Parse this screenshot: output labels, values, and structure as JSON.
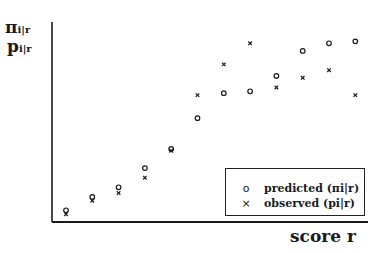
{
  "chart_data": {
    "type": "scatter",
    "title": "",
    "xlabel": "score r",
    "ylabel": [
      "πi|r",
      "pi|r"
    ],
    "x": [
      1,
      2,
      3,
      4,
      5,
      6,
      7,
      8,
      9,
      10,
      11,
      12
    ],
    "series": [
      {
        "name": "predicted (πi|r)",
        "marker": "o",
        "values": [
          0.04,
          0.11,
          0.16,
          0.26,
          0.36,
          0.52,
          0.65,
          0.66,
          0.74,
          0.87,
          0.91,
          0.92
        ]
      },
      {
        "name": "observed (pi|r)",
        "marker": "x",
        "values": [
          0.02,
          0.09,
          0.13,
          0.21,
          0.35,
          0.64,
          0.8,
          0.91,
          0.68,
          0.73,
          0.77,
          0.64
        ]
      }
    ],
    "grid": false,
    "legend_position": "lower right",
    "xlim": [
      0.4,
      12.8
    ],
    "ylim": [
      0,
      1
    ]
  },
  "axes": {
    "y_label_main_1": "π",
    "y_label_sub_1": "i|r",
    "y_label_main_2": "p",
    "y_label_sub_2": "i|r",
    "x_label": "score r"
  },
  "legend": {
    "items": [
      {
        "symbol": "o",
        "label": "predicted (πi|r)"
      },
      {
        "symbol": "×",
        "label": "observed (pi|r)"
      }
    ]
  },
  "style": {
    "ink": "#1a1a1a",
    "background": "#ffffff"
  }
}
